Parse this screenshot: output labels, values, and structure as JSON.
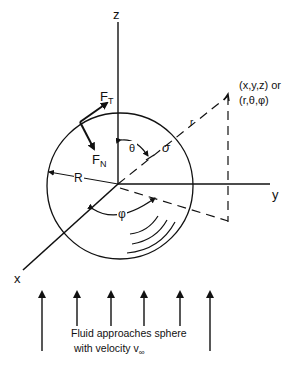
{
  "diagram": {
    "axes": {
      "x_label": "x",
      "y_label": "y",
      "z_label": "z"
    },
    "sphere": {
      "radius_label": "R"
    },
    "forces": {
      "tangential": {
        "label": "F",
        "sub": "T"
      },
      "normal": {
        "label": "F",
        "sub": "N"
      }
    },
    "angles": {
      "polar": "θ",
      "azimuthal": "φ",
      "stress": "σ"
    },
    "point": {
      "radius_label": "r",
      "cartesian": "(x,y,z) or",
      "spherical": "(r,θ,φ)"
    },
    "flow": {
      "caption_line1": "Fluid approaches sphere",
      "caption_line2": "with velocity v",
      "caption_sub": "∞",
      "arrow_count": 6
    },
    "colors": {
      "ink": "#111111",
      "background": "#ffffff"
    }
  }
}
